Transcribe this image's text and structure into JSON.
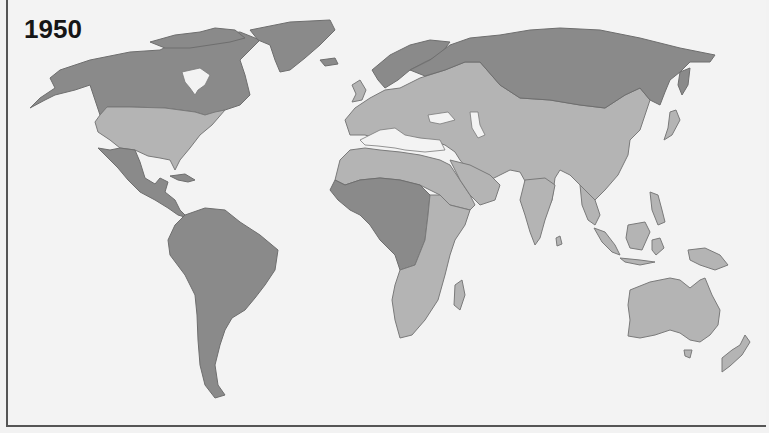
{
  "map": {
    "title": "1950",
    "colors": {
      "background": "#f3f3f3",
      "category_dark": "#8a8a8a",
      "category_light": "#b4b4b4",
      "border": "#555555"
    },
    "regions": [
      {
        "name": "Canada & Alaska",
        "category": "dark"
      },
      {
        "name": "Greenland",
        "category": "dark"
      },
      {
        "name": "United States",
        "category": "light"
      },
      {
        "name": "Mexico & Central America",
        "category": "dark"
      },
      {
        "name": "South America",
        "category": "dark"
      },
      {
        "name": "Northern Europe / Scandinavia",
        "category": "dark"
      },
      {
        "name": "Europe",
        "category": "light"
      },
      {
        "name": "North Africa",
        "category": "light"
      },
      {
        "name": "Central Africa",
        "category": "dark"
      },
      {
        "name": "East & Southern Africa",
        "category": "light"
      },
      {
        "name": "Middle East",
        "category": "light"
      },
      {
        "name": "Russia / Northern Asia",
        "category": "dark"
      },
      {
        "name": "Central & South Asia",
        "category": "light"
      },
      {
        "name": "China & East Asia",
        "category": "light"
      },
      {
        "name": "Southeast Asia",
        "category": "light"
      },
      {
        "name": "Australia",
        "category": "light"
      },
      {
        "name": "New Zealand",
        "category": "light"
      }
    ]
  }
}
